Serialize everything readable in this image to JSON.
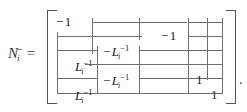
{
  "figure": {
    "kind": "math-equation",
    "lhs": {
      "base": "N",
      "subscript": "i",
      "superscript": "−",
      "relation": "="
    },
    "trailing_punctuation": ".",
    "bracket": {
      "left": "[",
      "right": "]"
    },
    "matrix": {
      "rows": 5,
      "entries": [
        {
          "id": "e-r1c1",
          "row": 1,
          "col": 1,
          "text": "−1",
          "minus": "−",
          "value": "1",
          "exponent": "",
          "x": 56,
          "y": 14
        },
        {
          "id": "e-r2c4",
          "row": 2,
          "col": 4,
          "text": "−1",
          "minus": "−",
          "value": "1",
          "exponent": "",
          "x": 161,
          "y": 28
        },
        {
          "id": "e-r3c3",
          "row": 3,
          "col": 3,
          "text": "−Lᵢ⁻¹",
          "minus": "−",
          "value": "L",
          "subscript": "i",
          "exponent": "−1",
          "x": 103,
          "y": 43
        },
        {
          "id": "e-r4c2",
          "row": 4,
          "col": 2,
          "text": "Lᵢ⁻¹",
          "minus": "",
          "value": "L",
          "subscript": "i",
          "exponent": "−1",
          "x": 75,
          "y": 58
        },
        {
          "id": "e-r5c3",
          "row": 5,
          "col": 3,
          "text": "−Lᵢ⁻¹",
          "minus": "−",
          "value": "L",
          "subscript": "i",
          "exponent": "−1",
          "x": 103,
          "y": 72
        },
        {
          "id": "e-r5c5",
          "row": 5,
          "col": 5,
          "text": "1",
          "minus": "",
          "value": "1",
          "exponent": "",
          "x": 196,
          "y": 72
        },
        {
          "id": "e-r6c2",
          "row": 6,
          "col": 2,
          "text": "Lᵢ⁻¹",
          "minus": "",
          "value": "L",
          "subscript": "i",
          "exponent": "−1",
          "x": 75,
          "y": 87
        },
        {
          "id": "e-r6c6",
          "row": 6,
          "col": 6,
          "text": "1",
          "minus": "",
          "value": "1",
          "exponent": "",
          "x": 211,
          "y": 87
        }
      ]
    },
    "rules": {
      "color": "#6f6f6f",
      "horizontal": [
        {
          "x": 92,
          "y": 22,
          "w": 95
        },
        {
          "x": 188,
          "y": 22,
          "w": 34
        },
        {
          "x": 57,
          "y": 36,
          "w": 85
        },
        {
          "x": 188,
          "y": 36,
          "w": 34
        },
        {
          "x": 57,
          "y": 50,
          "w": 40
        },
        {
          "x": 139,
          "y": 50,
          "w": 83
        },
        {
          "x": 85,
          "y": 64,
          "w": 137
        },
        {
          "x": 57,
          "y": 78,
          "w": 40
        },
        {
          "x": 139,
          "y": 78,
          "w": 83
        },
        {
          "x": 57,
          "y": 93,
          "w": 165
        }
      ],
      "vertical": [
        {
          "x": 57,
          "y": 32,
          "h": 62
        },
        {
          "x": 92,
          "y": 18,
          "h": 36
        },
        {
          "x": 97,
          "y": 46,
          "h": 48
        },
        {
          "x": 139,
          "y": 18,
          "h": 22
        },
        {
          "x": 139,
          "y": 46,
          "h": 48
        },
        {
          "x": 188,
          "y": 18,
          "h": 76
        },
        {
          "x": 207,
          "y": 18,
          "h": 62
        },
        {
          "x": 222,
          "y": 18,
          "h": 76
        }
      ]
    }
  }
}
